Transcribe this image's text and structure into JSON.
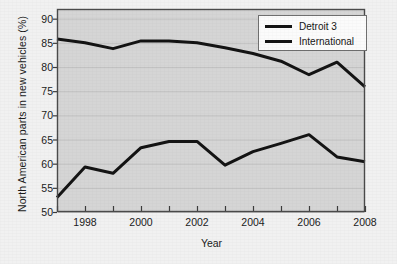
{
  "chart_data": {
    "type": "line",
    "title": "",
    "xlabel": "Year",
    "ylabel": "North American parts in new vehicles (%)",
    "xlim": [
      1997,
      2008
    ],
    "ylim": [
      50,
      92
    ],
    "grid": true,
    "legend_position": "top-right",
    "x": [
      1997,
      1998,
      1999,
      2000,
      2001,
      2002,
      2003,
      2004,
      2005,
      2006,
      2007,
      2008
    ],
    "xticks": [
      1997,
      1998,
      1999,
      2000,
      2001,
      2002,
      2003,
      2004,
      2005,
      2006,
      2007,
      2008
    ],
    "xtick_labels": [
      "",
      "1998",
      "",
      "2000",
      "",
      "2002",
      "",
      "2004",
      "",
      "2006",
      "",
      "2008"
    ],
    "yticks": [
      50,
      55,
      60,
      65,
      70,
      75,
      80,
      85,
      90
    ],
    "ytick_labels": [
      "50",
      "55",
      "60",
      "65",
      "70",
      "75",
      "80",
      "85",
      "90"
    ],
    "series": [
      {
        "name": "Detroit 3",
        "color": "#141414",
        "values": [
          85.8,
          85.0,
          83.8,
          85.4,
          85.4,
          85.0,
          84.0,
          82.8,
          81.2,
          78.4,
          81.0,
          75.9
        ]
      },
      {
        "name": "International",
        "color": "#141414",
        "values": [
          53.0,
          59.3,
          58.0,
          63.3,
          64.6,
          64.6,
          59.7,
          62.5,
          64.2,
          66.0,
          61.4,
          60.4
        ]
      }
    ]
  },
  "legend": {
    "items": [
      {
        "label": "Detroit 3"
      },
      {
        "label": "International"
      }
    ]
  },
  "axes": {
    "x_axis_title": "Year",
    "y_axis_title": "North American parts in new vehicles (%)"
  },
  "colors": {
    "line": "#141414",
    "plot_background": "#d5d5d5",
    "page_background": "#f1f1f1",
    "frame": "#4a4a4a",
    "gridline": "#c2c2c2"
  }
}
